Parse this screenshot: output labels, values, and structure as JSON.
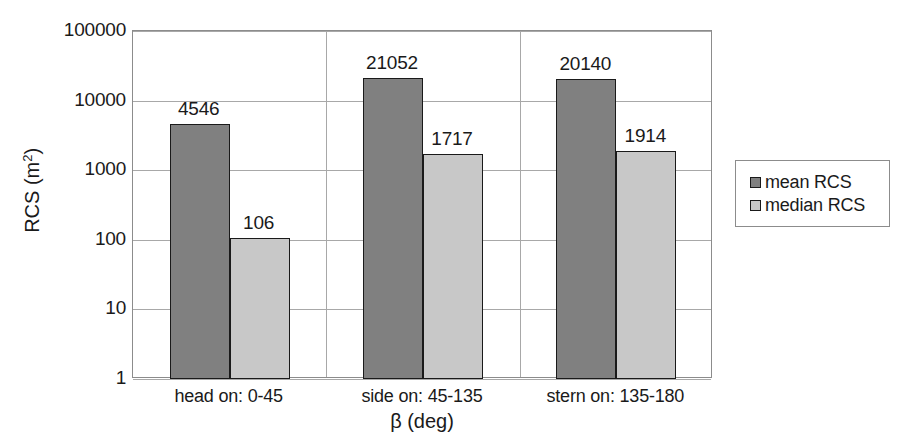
{
  "chart_data": {
    "type": "bar",
    "title": "",
    "xlabel": "β (deg)",
    "ylabel": "RCS (m²)",
    "ylabel_base": "RCS (m",
    "ylabel_sup": "2",
    "ylabel_close": ")",
    "yscale": "log",
    "ylim": [
      1,
      100000
    ],
    "ytick_labels": [
      "100000",
      "10000",
      "1000",
      "100",
      "10",
      "1"
    ],
    "ytick_values": [
      100000,
      10000,
      1000,
      100,
      10,
      1
    ],
    "grid": true,
    "legend_position": "right",
    "categories": [
      "head on:  0-45",
      "side on: 45-135",
      "stern on: 135-180"
    ],
    "series": [
      {
        "name": "mean RCS",
        "color": "#808080",
        "values": [
          4546,
          21052,
          20140
        ],
        "labels": [
          "4546",
          "21052",
          "20140"
        ]
      },
      {
        "name": "median RCS",
        "color": "#c8c8c8",
        "values": [
          106,
          1717,
          1914
        ],
        "labels": [
          "106",
          "1717",
          "1914"
        ]
      }
    ]
  },
  "legend": {
    "entries": [
      {
        "label": "mean RCS",
        "color": "#808080"
      },
      {
        "label": "median RCS",
        "color": "#c8c8c8"
      }
    ]
  }
}
